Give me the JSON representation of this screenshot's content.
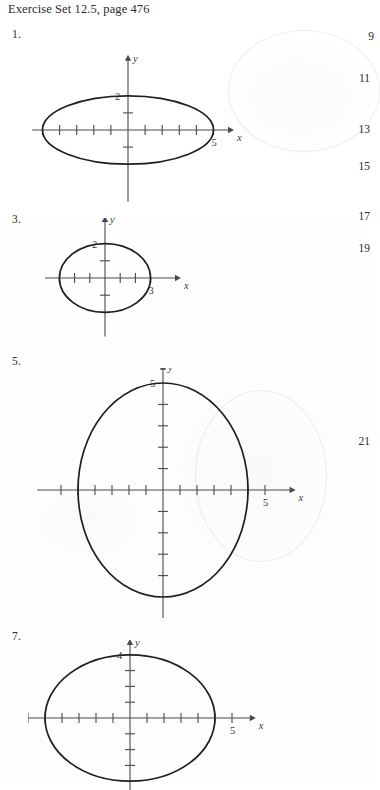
{
  "page": {
    "header": "Exercise Set 12.5, page 476",
    "width": 372,
    "height": 782,
    "background_color": "#ffffff",
    "ink_color": "#1f1f1f",
    "axis_color": "#4a4a4a"
  },
  "right_column_numbers": [
    {
      "label": "9",
      "x": 352,
      "y": 30
    },
    {
      "label": "11",
      "x": 348,
      "y": 72
    },
    {
      "label": "13",
      "x": 348,
      "y": 123
    },
    {
      "label": "15",
      "x": 348,
      "y": 160
    },
    {
      "label": "17",
      "x": 348,
      "y": 210
    },
    {
      "label": "19",
      "x": 348,
      "y": 242
    },
    {
      "label": "21",
      "x": 348,
      "y": 435
    }
  ],
  "problems": [
    {
      "number": "1.",
      "number_x": 12,
      "number_y": 28,
      "chart_data": {
        "type": "line",
        "shape": "ellipse",
        "title": "",
        "xlabel": "x",
        "ylabel": "y",
        "center": [
          0,
          0
        ],
        "semi_axis_x": 5,
        "semi_axis_y": 2,
        "x_labels": [
          {
            "text": "5",
            "value": 5
          }
        ],
        "y_labels": [
          {
            "text": "2",
            "value": 2
          }
        ],
        "x_tick_values": [
          -5,
          -4,
          -3,
          -2,
          -1,
          1,
          2,
          3,
          4,
          5
        ],
        "y_tick_values": [
          -1,
          1
        ],
        "xlim": [
          -5.6,
          6.2
        ],
        "ylim": [
          -4.2,
          4.4
        ],
        "grid": false,
        "legend": "none"
      },
      "geometry": {
        "left": 14,
        "top": 26,
        "width": 245,
        "height": 180,
        "cx": 114,
        "cy": 104,
        "unit_x": 17.1,
        "unit_y": 17.1,
        "x_axis_from": -5.6,
        "x_axis_to": 6.2,
        "y_axis_from": -4.2,
        "y_axis_to": 4.4,
        "tick_len_x": 5,
        "tick_len_y": 5,
        "clip_bottom": false
      }
    },
    {
      "number": "3.",
      "number_x": 12,
      "number_y": 213,
      "chart_data": {
        "type": "line",
        "shape": "ellipse",
        "title": "",
        "xlabel": "x",
        "ylabel": "y",
        "center": [
          0,
          0
        ],
        "semi_axis_x": 3,
        "semi_axis_y": 2,
        "x_labels": [
          {
            "text": "3",
            "value": 3
          }
        ],
        "y_labels": [
          {
            "text": "2",
            "value": 2
          }
        ],
        "x_tick_values": [
          -3,
          -2,
          -1,
          1,
          2,
          3
        ],
        "y_tick_values": [
          -2,
          -1,
          1
        ],
        "xlim": [
          -4.2,
          5.0
        ],
        "ylim": [
          -3.4,
          3.6
        ],
        "grid": false,
        "legend": "none"
      },
      "geometry": {
        "left": 45,
        "top": 218,
        "width": 185,
        "height": 125,
        "cx": 60,
        "cy": 60,
        "unit_x": 15.2,
        "unit_y": 17.2,
        "x_axis_from": -4.2,
        "x_axis_to": 5.0,
        "y_axis_from": -3.4,
        "y_axis_to": 3.6,
        "tick_len_x": 5,
        "tick_len_y": 5,
        "clip_bottom": false
      }
    },
    {
      "number": "5.",
      "number_x": 12,
      "number_y": 355,
      "chart_data": {
        "type": "line",
        "shape": "ellipse",
        "title": "",
        "xlabel": "x",
        "ylabel": "y",
        "center": [
          0,
          0
        ],
        "semi_axis_x": 5,
        "semi_axis_y": 5,
        "x_labels": [
          {
            "text": "5",
            "value": 6
          }
        ],
        "y_labels": [
          {
            "text": "5",
            "value": 5
          }
        ],
        "x_tick_values": [
          -6,
          -5,
          -4,
          -3,
          -2,
          -1,
          1,
          2,
          3,
          4,
          5,
          6
        ],
        "y_tick_values": [
          -4,
          -3,
          -2,
          -1,
          1,
          2,
          3,
          4
        ],
        "xlim": [
          -7.4,
          7.8
        ],
        "ylim": [
          -6.2,
          5.9
        ],
        "grid": false,
        "legend": "none"
      },
      "geometry": {
        "left": 28,
        "top": 368,
        "width": 300,
        "height": 250,
        "cx": 135,
        "cy": 122,
        "unit_x": 17.0,
        "unit_y": 21.4,
        "x_axis_from": -7.4,
        "x_axis_to": 7.8,
        "y_axis_from": -6.2,
        "y_axis_to": 5.9,
        "tick_len_x": 5,
        "tick_len_y": 5,
        "clip_bottom": false
      }
    },
    {
      "number": "7.",
      "number_x": 12,
      "number_y": 630,
      "chart_data": {
        "type": "line",
        "shape": "ellipse",
        "title": "",
        "xlabel": "x",
        "ylabel": "y",
        "center": [
          0,
          0
        ],
        "semi_axis_x": 5,
        "semi_axis_y": 4,
        "x_labels": [
          {
            "text": "5",
            "value": 6
          }
        ],
        "y_labels": [
          {
            "text": "4",
            "value": 4
          }
        ],
        "x_tick_values": [
          -6,
          -5,
          -4,
          -3,
          -2,
          -1,
          1,
          2,
          3,
          4,
          5,
          6
        ],
        "y_tick_values": [
          -3,
          -2,
          -1,
          1,
          2,
          3
        ],
        "xlim": [
          -7.2,
          7.4
        ],
        "ylim": [
          -5.2,
          5.0
        ],
        "grid": false,
        "legend": "none"
      },
      "geometry": {
        "left": 28,
        "top": 640,
        "width": 290,
        "height": 150,
        "cx": 102,
        "cy": 78,
        "unit_x": 17.0,
        "unit_y": 15.8,
        "x_axis_from": -7.2,
        "x_axis_to": 7.4,
        "y_axis_from": -5.2,
        "y_axis_to": 5.0,
        "tick_len_x": 5,
        "tick_len_y": 5,
        "clip_bottom": true
      }
    }
  ]
}
